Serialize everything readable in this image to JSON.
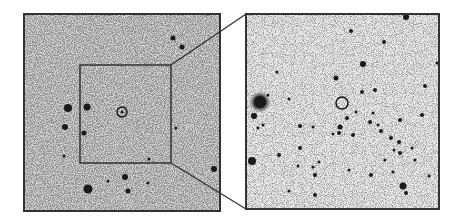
{
  "figure": {
    "left_panel": {
      "label": "wide-field view",
      "x": 24,
      "y": 14,
      "width": 196,
      "height": 197,
      "background": "#d9d9d9",
      "border_color": "#333333",
      "zoom_box": {
        "x": 80,
        "y": 65,
        "width": 91,
        "height": 98
      },
      "target_circle": {
        "cx": 122,
        "cy": 112,
        "r": 5
      },
      "stars": [
        [
          68,
          108,
          4
        ],
        [
          87,
          107,
          3.5
        ],
        [
          65,
          127,
          3
        ],
        [
          84,
          133,
          2.5
        ],
        [
          88,
          189,
          4.5
        ],
        [
          125,
          177,
          3
        ],
        [
          128,
          191,
          2.5
        ],
        [
          173,
          38,
          2.5
        ],
        [
          182,
          47,
          2.5
        ],
        [
          214,
          169,
          3
        ],
        [
          108,
          181,
          1.5
        ],
        [
          148,
          183,
          1.5
        ],
        [
          176,
          128,
          1.5
        ],
        [
          122,
          112,
          1.5
        ],
        [
          64,
          156,
          1.5
        ],
        [
          149,
          159,
          1.5
        ]
      ]
    },
    "right_panel": {
      "label": "zoomed view",
      "x": 246,
      "y": 14,
      "width": 193,
      "height": 195,
      "background": "#ececec",
      "border_color": "#333333",
      "target_circle": {
        "cx": 342,
        "cy": 103,
        "r": 6
      },
      "stars": [
        [
          260,
          102,
          6
        ],
        [
          254,
          116,
          3
        ],
        [
          252,
          161,
          4
        ],
        [
          406,
          17,
          3
        ],
        [
          351,
          31,
          2
        ],
        [
          384,
          42,
          2
        ],
        [
          363,
          64,
          3
        ],
        [
          336,
          78,
          2.5
        ],
        [
          362,
          92,
          2
        ],
        [
          375,
          90,
          2
        ],
        [
          347,
          118,
          2
        ],
        [
          340,
          127,
          2.5
        ],
        [
          339,
          133,
          2
        ],
        [
          353,
          135,
          2
        ],
        [
          300,
          126,
          2
        ],
        [
          313,
          127,
          1.5
        ],
        [
          381,
          131,
          2
        ],
        [
          378,
          125,
          1.5
        ],
        [
          370,
          122,
          2
        ],
        [
          391,
          138,
          2
        ],
        [
          399,
          142,
          2
        ],
        [
          400,
          153,
          2
        ],
        [
          394,
          150,
          1.5
        ],
        [
          412,
          148,
          1.5
        ],
        [
          403,
          186,
          3.5
        ],
        [
          406,
          193,
          2
        ],
        [
          371,
          175,
          2
        ],
        [
          315,
          175,
          2
        ],
        [
          313,
          167,
          1.5
        ],
        [
          315,
          195,
          2
        ],
        [
          320,
          210,
          1.5
        ],
        [
          289,
          191,
          1.5
        ],
        [
          279,
          155,
          2
        ],
        [
          300,
          148,
          2
        ],
        [
          349,
          170,
          1.5
        ],
        [
          400,
          120,
          2
        ],
        [
          422,
          115,
          2
        ],
        [
          425,
          86,
          2
        ],
        [
          437,
          63,
          1.5
        ],
        [
          298,
          166,
          1.5
        ],
        [
          319,
          162,
          1.5
        ],
        [
          268,
          95,
          1.5
        ],
        [
          289,
          99,
          1.5
        ],
        [
          277,
          72,
          1.5
        ],
        [
          263,
          125,
          1.5
        ],
        [
          258,
          128,
          1.5
        ],
        [
          415,
          160,
          1.5
        ],
        [
          429,
          176,
          1.5
        ],
        [
          393,
          172,
          1.5
        ],
        [
          385,
          160,
          1.5
        ],
        [
          333,
          134,
          1.5
        ],
        [
          356,
          112,
          1.5
        ],
        [
          373,
          113,
          1.5
        ]
      ]
    },
    "connector_lines": [
      {
        "from": [
          171,
          65
        ],
        "to": [
          246,
          14
        ]
      },
      {
        "from": [
          171,
          163
        ],
        "to": [
          246,
          209
        ]
      }
    ],
    "colors": {
      "line": "#333333",
      "star": "#1a1a1a",
      "circle": "#111111"
    }
  }
}
